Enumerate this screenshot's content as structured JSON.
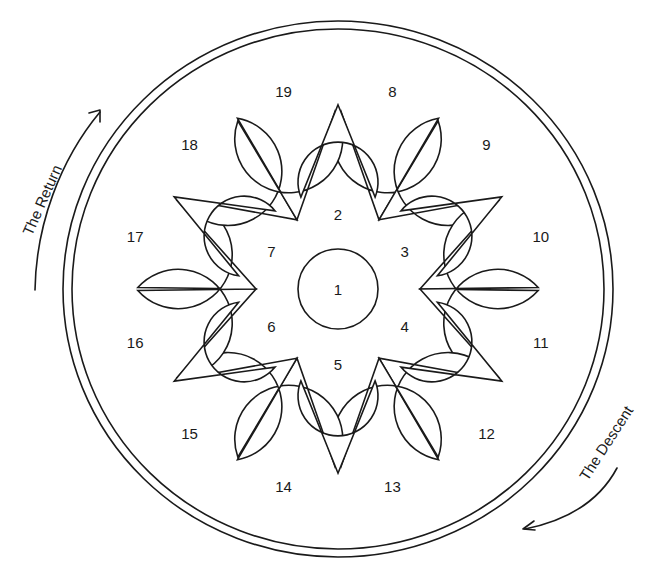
{
  "diagram": {
    "title": "",
    "center": {
      "x": 338,
      "y": 289
    },
    "outer_ring": {
      "rx": 275,
      "ry": 268
    },
    "inner_ring": {
      "rx": 266,
      "ry": 260
    },
    "stroke_color": "#1a1a1a",
    "background": "#ffffff",
    "center_circle": {
      "label": "1",
      "r": 40
    },
    "inner_petals": [
      {
        "label": "2",
        "angle": 0
      },
      {
        "label": "3",
        "angle": 60
      },
      {
        "label": "4",
        "angle": 120
      },
      {
        "label": "5",
        "angle": 180
      },
      {
        "label": "6",
        "angle": 240
      },
      {
        "label": "7",
        "angle": 300
      }
    ],
    "inner_petal_geometry": {
      "head_dist": 79,
      "head_r": 40,
      "tip_dist": 189,
      "label_dist": 77
    },
    "outer_petals": [
      {
        "label": "8",
        "angle": 15,
        "tip_angle": 30
      },
      {
        "label": "9",
        "angle": 45,
        "tip_angle": 30
      },
      {
        "label": "10",
        "angle": 75,
        "tip_angle": 90
      },
      {
        "label": "11",
        "angle": 105,
        "tip_angle": 90
      },
      {
        "label": "12",
        "angle": 135,
        "tip_angle": 150
      },
      {
        "label": "13",
        "angle": 165,
        "tip_angle": 150
      },
      {
        "label": "14",
        "angle": 195,
        "tip_angle": 210
      },
      {
        "label": "15",
        "angle": 225,
        "tip_angle": 210
      },
      {
        "label": "16",
        "angle": 255,
        "tip_angle": 270
      },
      {
        "label": "17",
        "angle": 285,
        "tip_angle": 270
      },
      {
        "label": "18",
        "angle": 315,
        "tip_angle": 330
      },
      {
        "label": "19",
        "angle": 345,
        "tip_angle": 330
      }
    ],
    "outer_petal_geometry": {
      "head_dist": 208,
      "head_r": 54,
      "tip_dist": 82,
      "label_dist": 210
    },
    "annotations": {
      "return": {
        "label": "The Return",
        "x": 42,
        "y": 200,
        "rotate": -66
      },
      "descent": {
        "label": "The Descent",
        "x": 606,
        "y": 443,
        "rotate": -57
      }
    }
  }
}
